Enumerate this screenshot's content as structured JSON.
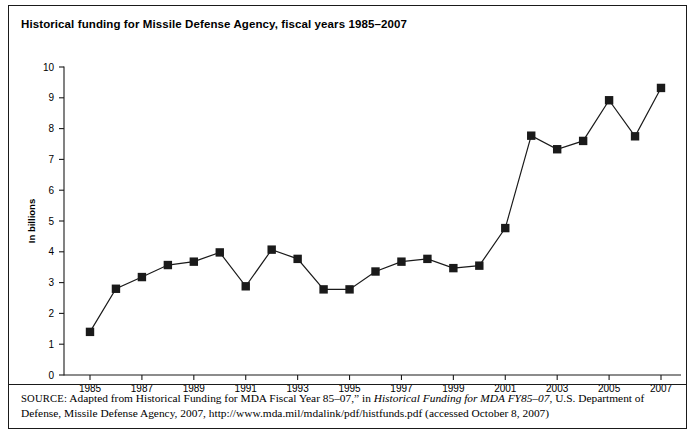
{
  "figure": {
    "title": "Historical funding for Missile Defense Agency, fiscal years 1985–2007",
    "border_color": "#1a1a1a",
    "background": "#ffffff"
  },
  "source": {
    "label": "SOURCE:",
    "text_part1": " Adapted from Historical Funding for MDA Fiscal Year 85–07,” in ",
    "italic_title": "Historical Funding for MDA FY85–07",
    "text_part2": ", U.S. Department of Defense, Missile Defense Agency, 2007, http://www.mda.mil/mdalink/pdf/histfunds.pdf (accessed October 8, 2007)"
  },
  "chart_data": {
    "type": "line",
    "title": "Historical funding for Missile Defense Agency, fiscal years 1985–2007",
    "xlabel": "",
    "ylabel": "In billions",
    "ylim": [
      0,
      10
    ],
    "xlim": [
      1985,
      2007
    ],
    "ytick_labels": [
      "0",
      "1",
      "2",
      "3",
      "4",
      "5",
      "6",
      "7",
      "8",
      "9",
      "10"
    ],
    "ytick_values": [
      0,
      1,
      2,
      3,
      4,
      5,
      6,
      7,
      8,
      9,
      10
    ],
    "xtick_labels": [
      "1985",
      "1987",
      "1989",
      "1991",
      "1993",
      "1995",
      "1997",
      "1999",
      "2001",
      "2003",
      "2005",
      "2007"
    ],
    "xtick_values": [
      1985,
      1987,
      1989,
      1991,
      1993,
      1995,
      1997,
      1999,
      2001,
      2003,
      2005,
      2007
    ],
    "grid": false,
    "legend": null,
    "marker": "filled-square",
    "marker_color": "#1a1a1a",
    "line_color": "#1a1a1a",
    "x": [
      1985,
      1986,
      1987,
      1988,
      1989,
      1990,
      1991,
      1992,
      1993,
      1994,
      1995,
      1996,
      1997,
      1998,
      1999,
      2000,
      2001,
      2002,
      2003,
      2004,
      2005,
      2006,
      2007
    ],
    "values": [
      1.4,
      2.8,
      3.18,
      3.57,
      3.68,
      3.98,
      2.88,
      4.07,
      3.77,
      2.78,
      2.78,
      3.36,
      3.68,
      3.77,
      3.47,
      3.55,
      4.77,
      7.77,
      7.33,
      7.6,
      8.92,
      7.75,
      9.32
    ]
  }
}
